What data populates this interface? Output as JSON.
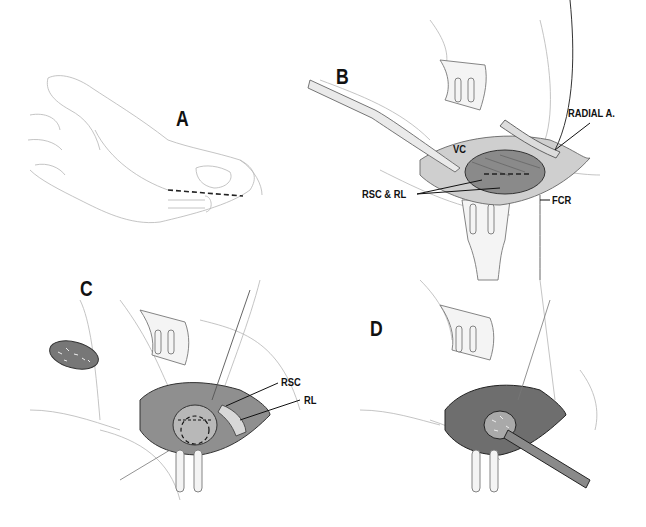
{
  "figure": {
    "panels": [
      {
        "id": "A",
        "letter": "A",
        "description": "Hand and wrist, volar view, with dashed incision line over radial wrist",
        "labels": []
      },
      {
        "id": "B",
        "letter": "B",
        "description": "Exposure with retractors; capsule incision over radioscaphocapitate and radiolunate ligaments",
        "labels": [
          {
            "key": "vc",
            "text": "VC"
          },
          {
            "key": "radial_artery",
            "text": "RADIAL A."
          },
          {
            "key": "rsc_rl",
            "text": "RSC & RL"
          },
          {
            "key": "fcr",
            "text": "FCR"
          }
        ]
      },
      {
        "id": "C",
        "letter": "C",
        "description": "Ligaments retracted exposing bone with dashed outline; graft shown at left",
        "labels": [
          {
            "key": "rsc",
            "text": "RSC"
          },
          {
            "key": "rl",
            "text": "RL"
          }
        ]
      },
      {
        "id": "D",
        "letter": "D",
        "description": "Graft inserted with instrument into prepared site",
        "labels": []
      }
    ]
  },
  "colors": {
    "ink": "#111111",
    "sketch": "#9a9a9a",
    "shade": "#555555",
    "dark": "#2a2a2a",
    "paper": "#ffffff"
  }
}
